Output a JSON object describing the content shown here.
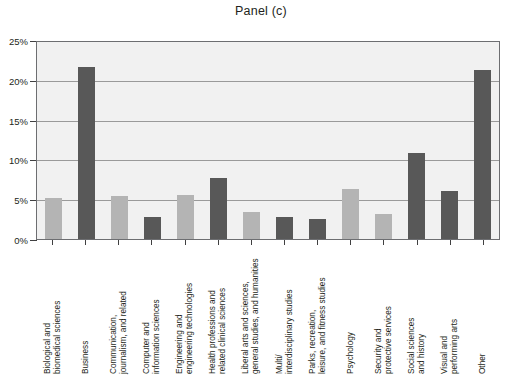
{
  "chart_data": {
    "type": "bar",
    "title": "Panel (c)",
    "xlabel": "",
    "ylabel": "",
    "ylim": [
      0,
      25
    ],
    "ytick_labels": [
      "0%",
      "5%",
      "10%",
      "15%",
      "20%",
      "25%"
    ],
    "ytick_values": [
      0,
      5,
      10,
      15,
      20,
      25
    ],
    "grid": true,
    "legend": "none",
    "value_unit": "percent",
    "categories": [
      "Biological and\nbiomedical sciences",
      "Business",
      "Communication,\njournalism, and related",
      "Computer and\ninformation sciences",
      "Engineering and\nengineering technologies",
      "Health professions and\nrelated clinical sciences",
      "Liberal arts and sciences,\ngeneral studies, and humanities",
      "Multi/\ninterdisciplinary studies",
      "Parks, recreation,\nleisure, and fitness studies",
      "Psychology",
      "Security and\nprotective services",
      "Social sciences\nand history",
      "Visual and\nperforming arts",
      "Other"
    ],
    "values": [
      5.2,
      21.8,
      5.4,
      2.8,
      5.6,
      7.8,
      3.4,
      2.8,
      2.5,
      6.4,
      3.2,
      10.9,
      6.1,
      21.5
    ],
    "bar_shades": [
      "light",
      "dark",
      "light",
      "dark",
      "light",
      "dark",
      "light",
      "dark",
      "dark",
      "light",
      "light",
      "dark",
      "dark",
      "dark"
    ],
    "colors": {
      "bar_light": "#b4b4b4",
      "bar_dark": "#585858",
      "plot_background": "#f1f1f1",
      "gridline": "#9a9a9a",
      "axis": "#6d6e71",
      "text": "#231f20"
    }
  }
}
